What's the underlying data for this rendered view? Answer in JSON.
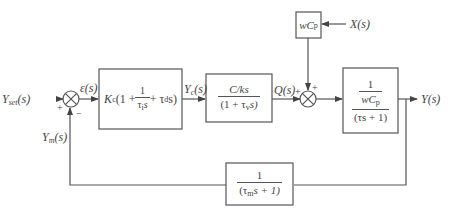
{
  "diagram": {
    "type": "feedback-control-block-diagram",
    "signals": {
      "setpoint": "Y_set(s)",
      "error": "ε(s)",
      "controller_output": "Y_c(s)",
      "flow": "Q(s)",
      "disturbance": "X(s)",
      "output": "Y(s)",
      "measured": "Y_m(s)"
    },
    "labels": {
      "setpoint_main": "Y",
      "setpoint_sub": "set",
      "setpoint_arg": "(s)",
      "error": "ε(s)",
      "controller_out_main": "Y",
      "controller_out_sub": "c",
      "controller_out_arg": "(s)",
      "flow": "Q(s)",
      "disturbance": "X(s)",
      "output": "Y(s)",
      "measured_main": "Y",
      "measured_sub": "m",
      "measured_arg": "(s)"
    },
    "signs": {
      "junction1_setpoint": "+",
      "junction1_feedback": "−",
      "junction2_flow": "+",
      "junction2_disturbance": "+"
    },
    "blocks": {
      "controller": {
        "prefix": "K",
        "prefix_sub": "c",
        "open": "(1 + ",
        "frac_num": "1",
        "frac_den_main": "τ",
        "frac_den_sub": "i",
        "frac_den_tail": "s",
        "tail_main": " + τ",
        "tail_sub": "d",
        "tail_end": "s)"
      },
      "valve": {
        "numerator": "C/ks",
        "denominator_open": "(1 + τ",
        "denominator_sub": "v",
        "denominator_close": "s)"
      },
      "disturbance_gain": {
        "main": "wC",
        "sub": "p"
      },
      "process": {
        "inner_num": "1",
        "inner_den_main": "wC",
        "inner_den_sub": "p",
        "denominator": "(τs + 1)"
      },
      "sensor": {
        "numerator": "1",
        "denominator_open": "(τ",
        "denominator_sub": "m",
        "denominator_close": "s + 1)"
      }
    },
    "colors": {
      "line": "#555555",
      "text": "#444444",
      "background": "#ffffff"
    }
  }
}
